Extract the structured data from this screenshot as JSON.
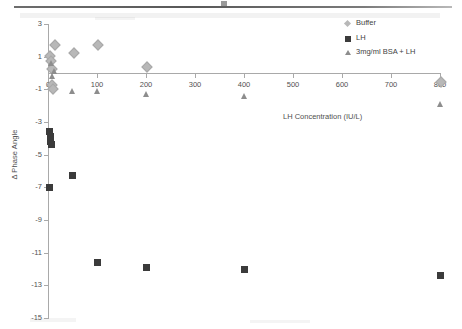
{
  "figure": {
    "axis_title_x": "LH Concentration (IU/L)",
    "axis_title_y": "Δ Phase Angle",
    "colors": {
      "buffer": "#b8b8b8",
      "lh": "#3b3b3b",
      "bsa_lh": "#8d8d8d",
      "axis": "#a9a9a9"
    }
  },
  "legend": {
    "position": "top-right",
    "entries": [
      {
        "label": "Buffer",
        "marker": "diamond-icon",
        "color": "#b8b8b8"
      },
      {
        "label": "LH",
        "marker": "square-icon",
        "color": "#3b3b3b"
      },
      {
        "label": "3mg/ml BSA + LH",
        "marker": "triangle-icon",
        "color": "#8d8d8d"
      }
    ]
  },
  "axes": {
    "y_ticks": [
      "3",
      "1",
      "-1",
      "-3",
      "-5",
      "-7",
      "-9",
      "-11",
      "-13",
      "-15"
    ],
    "y_values": [
      3,
      1,
      -1,
      -3,
      -5,
      -7,
      -9,
      -11,
      -13,
      -15
    ],
    "x_ticks": [
      "0",
      "100",
      "200",
      "300",
      "400",
      "500",
      "600",
      "700",
      "800"
    ],
    "x_values": [
      0,
      100,
      200,
      300,
      400,
      500,
      600,
      700,
      800
    ]
  },
  "chart_data": {
    "type": "scatter",
    "title": "",
    "xlabel": "LH Concentration (IU/L)",
    "ylabel": "Δ Phase Angle",
    "xlim": [
      0,
      800
    ],
    "ylim": [
      -15,
      3
    ],
    "grid": false,
    "legend_position": "top-right",
    "series": [
      {
        "name": "Buffer",
        "marker": "diamond",
        "color": "#b8b8b8",
        "points": [
          [
            3,
            1.1
          ],
          [
            5,
            0.8
          ],
          [
            6,
            0.3
          ],
          [
            7,
            -0.7
          ],
          [
            8,
            -0.9
          ],
          [
            12,
            1.8
          ],
          [
            50,
            1.3
          ],
          [
            100,
            1.8
          ],
          [
            200,
            0.4
          ],
          [
            800,
            -0.5
          ]
        ]
      },
      {
        "name": "LH",
        "marker": "square",
        "color": "#3b3b3b",
        "points": [
          [
            3,
            -3.6
          ],
          [
            5,
            -3.9
          ],
          [
            6,
            -4.2
          ],
          [
            8,
            -4.4
          ],
          [
            4,
            -7.0
          ],
          [
            50,
            -6.3
          ],
          [
            100,
            -11.6
          ],
          [
            200,
            -11.9
          ],
          [
            400,
            -12.0
          ],
          [
            800,
            -12.4
          ]
        ]
      },
      {
        "name": "3mg/ml BSA + LH",
        "marker": "triangle",
        "color": "#8d8d8d",
        "points": [
          [
            8,
            0.6
          ],
          [
            14,
            0.1
          ],
          [
            10,
            -0.2
          ],
          [
            50,
            -1.1
          ],
          [
            100,
            -1.1
          ],
          [
            200,
            -1.3
          ],
          [
            400,
            -1.4
          ],
          [
            800,
            -1.9
          ]
        ]
      }
    ]
  }
}
